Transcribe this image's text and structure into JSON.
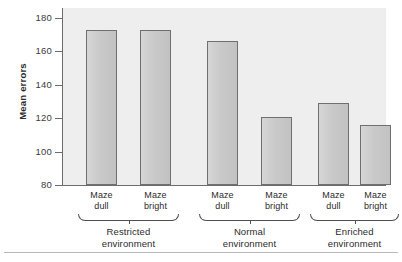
{
  "chart_data": {
    "type": "bar",
    "title": "",
    "xlabel": "",
    "ylabel": "Mean errors",
    "ylim": [
      80,
      180
    ],
    "yticks": [
      80,
      100,
      120,
      140,
      160,
      180
    ],
    "grid": false,
    "legend": "none",
    "categories": [
      "Maze dull",
      "Maze bright",
      "Maze dull",
      "Maze bright",
      "Maze dull",
      "Maze bright"
    ],
    "values": [
      173,
      173,
      166,
      121,
      129,
      116
    ],
    "groups": [
      {
        "label_line1": "Restricted",
        "label_line2": "environment",
        "bars": [
          {
            "label_line1": "Maze",
            "label_line2": "dull",
            "value": 173
          },
          {
            "label_line1": "Maze",
            "label_line2": "bright",
            "value": 173
          }
        ]
      },
      {
        "label_line1": "Normal",
        "label_line2": "environment",
        "bars": [
          {
            "label_line1": "Maze",
            "label_line2": "dull",
            "value": 166
          },
          {
            "label_line1": "Maze",
            "label_line2": "bright",
            "value": 121
          }
        ]
      },
      {
        "label_line1": "Enriched",
        "label_line2": "environment",
        "bars": [
          {
            "label_line1": "Maze",
            "label_line2": "dull",
            "value": 129
          },
          {
            "label_line1": "Maze",
            "label_line2": "bright",
            "value": 116
          }
        ]
      }
    ],
    "colors": {
      "bar_fill": "#cccccc",
      "bar_stroke": "#6f6f6f",
      "panel_background": "#eeeeee",
      "axis": "#6c6c6c",
      "text": "#2b2b2b"
    }
  },
  "axis": {
    "tick_labels": [
      "180",
      "160",
      "140",
      "120",
      "100",
      "80"
    ],
    "y_title": "Mean errors"
  }
}
